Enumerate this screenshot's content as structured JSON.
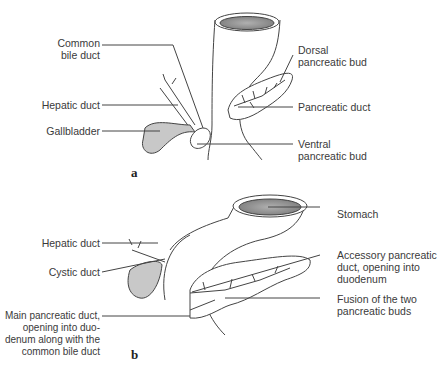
{
  "figure": {
    "panel_a": {
      "letter": "a",
      "labels": {
        "common_bile_duct_1": "Common",
        "common_bile_duct_2": "bile duct",
        "hepatic_duct": "Hepatic duct",
        "gallbladder": "Gallbladder",
        "dorsal_bud_1": "Dorsal",
        "dorsal_bud_2": "pancreatic bud",
        "pancreatic_duct": "Pancreatic duct",
        "ventral_bud_1": "Ventral",
        "ventral_bud_2": "pancreatic bud"
      }
    },
    "panel_b": {
      "letter": "b",
      "labels": {
        "hepatic_duct": "Hepatic duct",
        "cystic_duct": "Cystic duct",
        "main_duct_1": "Main pancreatic duct,",
        "main_duct_2": "opening into duo-",
        "main_duct_3": "denum along with the",
        "main_duct_4": "common bile duct",
        "stomach": "Stomach",
        "accessory_1": "Accessory pancreatic",
        "accessory_2": "duct, opening into",
        "accessory_3": "duodenum",
        "fusion_1": "Fusion of the two",
        "fusion_2": "pancreatic buds"
      }
    },
    "colors": {
      "organ_fill": "#c8c8c8",
      "outline": "#444444",
      "background": "#ffffff"
    }
  }
}
